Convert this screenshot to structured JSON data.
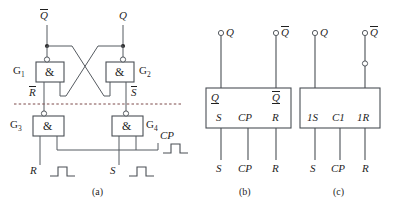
{
  "figure": {
    "captions": {
      "a": "(a)",
      "b": "(b)",
      "c": "(c)"
    }
  },
  "panel_a": {
    "caption": "(a)",
    "outputs": {
      "qbar": "Q",
      "q": "Q"
    },
    "gates": [
      {
        "name": "G",
        "index": "1",
        "symbol": "&"
      },
      {
        "name": "G",
        "index": "2",
        "symbol": "&"
      },
      {
        "name": "G",
        "index": "3",
        "symbol": "&"
      },
      {
        "name": "G",
        "index": "4",
        "symbol": "&"
      }
    ],
    "internal_signals": {
      "rbar": "R",
      "sbar": "S"
    },
    "inputs": {
      "r": "R",
      "s": "S",
      "cp": "CP"
    }
  },
  "panel_b": {
    "caption": "(b)",
    "terminals": {
      "q": "Q",
      "qbar": "Q"
    },
    "box_top_labels": {
      "q": "Q",
      "qbar": "Q"
    },
    "box_bottom_labels": {
      "s": "S",
      "cp": "CP",
      "r": "R"
    },
    "input_labels": {
      "s": "S",
      "cp": "CP",
      "r": "R"
    }
  },
  "panel_c": {
    "caption": "(c)",
    "terminals": {
      "q": "Q",
      "qbar": "Q"
    },
    "box_bottom_labels": {
      "s": "1S",
      "cp": "C1",
      "r": "1R"
    },
    "input_labels": {
      "s": "S",
      "cp": "CP",
      "r": "R"
    }
  },
  "colors": {
    "wire": "#555a60",
    "box_outline": "#4a4f55",
    "dashed_divider": "#7d4b4b",
    "text": "#1f1f1f",
    "background": "#ffffff"
  }
}
